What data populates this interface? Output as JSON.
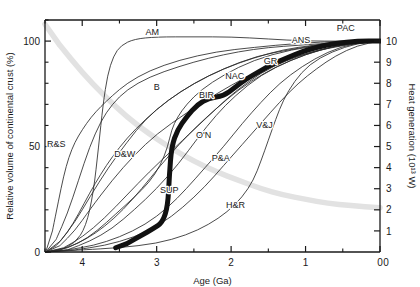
{
  "chart_data": {
    "type": "line",
    "title": "",
    "xlabel": "Age (Ga)",
    "ylabel_left": "Relative volume of continental crust (%)",
    "ylabel_right": "Heat generation (10¹³ W)",
    "xlim": [
      4.5,
      0
    ],
    "xticks": [
      4,
      3,
      2,
      1,
      0
    ],
    "xticks_minor": [
      4.5,
      3.5,
      2.5,
      1.5,
      0.5
    ],
    "ylim_left": [
      0,
      110
    ],
    "yticks_left": [
      0,
      50,
      100
    ],
    "yticks_left_minor": [
      10,
      20,
      30,
      40,
      60,
      70,
      80,
      90,
      110
    ],
    "ylim_right": [
      0,
      11
    ],
    "yticks_right": [
      1,
      2,
      3,
      4,
      5,
      6,
      7,
      8,
      9,
      10
    ],
    "grid": false,
    "legend_position": "inline-annotations",
    "colors": {
      "axis": "#1a1a1a",
      "curve": "#2b2b2b",
      "highlight_curve": "#111111",
      "gray_curve": "#e2e2e2"
    },
    "annotations": [
      {
        "label": "AM",
        "x_ga": 3.06,
        "y_pct": 103
      },
      {
        "label": "ANS",
        "x_ga": 1.06,
        "y_pct": 99
      },
      {
        "label": "PAC",
        "x_ga": 0.46,
        "y_pct": 105
      },
      {
        "label": "GR",
        "x_ga": 1.47,
        "y_pct": 89
      },
      {
        "label": "NAC",
        "x_ga": 1.95,
        "y_pct": 82
      },
      {
        "label": "BIR",
        "x_ga": 2.33,
        "y_pct": 73
      },
      {
        "label": "B",
        "x_ga": 3.0,
        "y_pct": 77
      },
      {
        "label": "O'N",
        "x_ga": 2.37,
        "y_pct": 54
      },
      {
        "label": "V&J",
        "x_ga": 1.55,
        "y_pct": 59
      },
      {
        "label": "D&W",
        "x_ga": 3.43,
        "y_pct": 45
      },
      {
        "label": "P&A",
        "x_ga": 2.14,
        "y_pct": 43
      },
      {
        "label": "SUP",
        "x_ga": 2.83,
        "y_pct": 28
      },
      {
        "label": "H&R",
        "x_ga": 1.94,
        "y_pct": 21
      },
      {
        "label": "R&S",
        "x_ga": 4.35,
        "y_pct": 50
      }
    ],
    "series": [
      {
        "name": "AM",
        "style": "thin",
        "points": [
          [
            4.49,
            0
          ],
          [
            4.3,
            1
          ],
          [
            4.1,
            4
          ],
          [
            3.95,
            12
          ],
          [
            3.85,
            28
          ],
          [
            3.78,
            50
          ],
          [
            3.72,
            70
          ],
          [
            3.66,
            84
          ],
          [
            3.58,
            93
          ],
          [
            3.48,
            98
          ],
          [
            3.3,
            101
          ],
          [
            3.0,
            102
          ],
          [
            2.5,
            102
          ],
          [
            2.0,
            102
          ],
          [
            1.5,
            101
          ],
          [
            1.0,
            100
          ],
          [
            0.5,
            100
          ],
          [
            0.0,
            100
          ]
        ]
      },
      {
        "name": "ANS",
        "style": "thin",
        "points": [
          [
            4.49,
            0
          ],
          [
            4.35,
            6
          ],
          [
            4.2,
            18
          ],
          [
            4.05,
            34
          ],
          [
            3.9,
            50
          ],
          [
            3.75,
            62
          ],
          [
            3.6,
            70
          ],
          [
            3.4,
            77
          ],
          [
            3.1,
            83
          ],
          [
            2.7,
            88
          ],
          [
            2.3,
            92
          ],
          [
            1.9,
            95
          ],
          [
            1.5,
            97
          ],
          [
            1.1,
            98
          ],
          [
            0.7,
            99
          ],
          [
            0.3,
            100
          ],
          [
            0.0,
            100
          ]
        ]
      },
      {
        "name": "GR",
        "style": "thin",
        "points": [
          [
            4.49,
            0
          ],
          [
            4.3,
            3
          ],
          [
            4.1,
            10
          ],
          [
            3.9,
            20
          ],
          [
            3.6,
            34
          ],
          [
            3.3,
            46
          ],
          [
            3.0,
            56
          ],
          [
            2.6,
            66
          ],
          [
            2.2,
            75
          ],
          [
            1.8,
            83
          ],
          [
            1.45,
            89
          ],
          [
            1.1,
            93
          ],
          [
            0.7,
            97
          ],
          [
            0.35,
            99
          ],
          [
            0.0,
            100
          ]
        ]
      },
      {
        "name": "NAC",
        "style": "thin",
        "points": [
          [
            4.49,
            0
          ],
          [
            4.25,
            2
          ],
          [
            4.0,
            7
          ],
          [
            3.7,
            16
          ],
          [
            3.4,
            27
          ],
          [
            3.1,
            38
          ],
          [
            2.8,
            48
          ],
          [
            2.5,
            58
          ],
          [
            2.2,
            68
          ],
          [
            1.95,
            76
          ],
          [
            1.6,
            85
          ],
          [
            1.25,
            91
          ],
          [
            0.9,
            95
          ],
          [
            0.5,
            98
          ],
          [
            0.0,
            100
          ]
        ]
      },
      {
        "name": "BIR",
        "style": "thin",
        "points": [
          [
            4.49,
            0
          ],
          [
            4.2,
            1
          ],
          [
            3.9,
            5
          ],
          [
            3.6,
            11
          ],
          [
            3.3,
            20
          ],
          [
            3.0,
            30
          ],
          [
            2.7,
            42
          ],
          [
            2.45,
            54
          ],
          [
            2.2,
            65
          ],
          [
            1.95,
            74
          ],
          [
            1.6,
            84
          ],
          [
            1.2,
            91
          ],
          [
            0.8,
            96
          ],
          [
            0.4,
            99
          ],
          [
            0.0,
            100
          ]
        ]
      },
      {
        "name": "B",
        "style": "thin",
        "points": [
          [
            4.49,
            0
          ],
          [
            4.3,
            5
          ],
          [
            4.1,
            14
          ],
          [
            3.9,
            26
          ],
          [
            3.65,
            40
          ],
          [
            3.4,
            52
          ],
          [
            3.15,
            63
          ],
          [
            2.85,
            72
          ],
          [
            2.5,
            80
          ],
          [
            2.1,
            87
          ],
          [
            1.7,
            92
          ],
          [
            1.3,
            96
          ],
          [
            0.9,
            98
          ],
          [
            0.45,
            100
          ],
          [
            0.0,
            100
          ]
        ]
      },
      {
        "name": "R&S",
        "style": "thin",
        "points": [
          [
            4.49,
            0
          ],
          [
            4.4,
            10
          ],
          [
            4.32,
            24
          ],
          [
            4.25,
            36
          ],
          [
            4.18,
            45
          ],
          [
            4.1,
            52
          ],
          [
            4.0,
            58
          ],
          [
            3.88,
            64
          ],
          [
            3.75,
            69
          ],
          [
            3.6,
            74
          ],
          [
            3.4,
            80
          ],
          [
            3.1,
            86
          ],
          [
            2.7,
            91
          ],
          [
            2.2,
            95
          ],
          [
            1.7,
            97
          ],
          [
            1.1,
            99
          ],
          [
            0.5,
            100
          ],
          [
            0.0,
            100
          ]
        ]
      },
      {
        "name": "D&W",
        "style": "thin",
        "points": [
          [
            4.49,
            0
          ],
          [
            4.35,
            3
          ],
          [
            4.2,
            9
          ],
          [
            4.05,
            18
          ],
          [
            3.9,
            28
          ],
          [
            3.75,
            37
          ],
          [
            3.6,
            45
          ],
          [
            3.4,
            54
          ],
          [
            3.15,
            63
          ],
          [
            2.85,
            72
          ],
          [
            2.5,
            80
          ],
          [
            2.1,
            87
          ],
          [
            1.65,
            93
          ],
          [
            1.2,
            96
          ],
          [
            0.7,
            99
          ],
          [
            0.0,
            100
          ]
        ]
      },
      {
        "name": "O'N",
        "style": "thin",
        "points": [
          [
            4.49,
            0
          ],
          [
            4.2,
            2
          ],
          [
            3.95,
            6
          ],
          [
            3.7,
            12
          ],
          [
            3.45,
            20
          ],
          [
            3.2,
            30
          ],
          [
            2.95,
            41
          ],
          [
            2.7,
            51
          ],
          [
            2.45,
            60
          ],
          [
            2.2,
            68
          ],
          [
            1.9,
            77
          ],
          [
            1.55,
            85
          ],
          [
            1.2,
            91
          ],
          [
            0.8,
            96
          ],
          [
            0.4,
            99
          ],
          [
            0.0,
            100
          ]
        ]
      },
      {
        "name": "V&J",
        "style": "thin",
        "points": [
          [
            4.49,
            0
          ],
          [
            4.1,
            1
          ],
          [
            3.7,
            3
          ],
          [
            3.3,
            7
          ],
          [
            2.95,
            13
          ],
          [
            2.65,
            21
          ],
          [
            2.35,
            31
          ],
          [
            2.1,
            41
          ],
          [
            1.85,
            51
          ],
          [
            1.6,
            61
          ],
          [
            1.35,
            71
          ],
          [
            1.1,
            80
          ],
          [
            0.85,
            87
          ],
          [
            0.6,
            93
          ],
          [
            0.3,
            98
          ],
          [
            0.0,
            100
          ]
        ]
      },
      {
        "name": "P&A",
        "style": "thin",
        "points": [
          [
            4.49,
            0
          ],
          [
            4.2,
            1
          ],
          [
            3.85,
            3
          ],
          [
            3.5,
            7
          ],
          [
            3.15,
            13
          ],
          [
            2.85,
            21
          ],
          [
            2.6,
            30
          ],
          [
            2.35,
            40
          ],
          [
            2.1,
            50
          ],
          [
            1.85,
            61
          ],
          [
            1.6,
            71
          ],
          [
            1.35,
            80
          ],
          [
            1.05,
            88
          ],
          [
            0.7,
            95
          ],
          [
            0.35,
            99
          ],
          [
            0.0,
            100
          ]
        ]
      },
      {
        "name": "SUP",
        "style": "thin",
        "points": [
          [
            4.49,
            0
          ],
          [
            4.3,
            1
          ],
          [
            4.05,
            4
          ],
          [
            3.8,
            10
          ],
          [
            3.55,
            18
          ],
          [
            3.3,
            26
          ],
          [
            3.1,
            33
          ],
          [
            2.95,
            41
          ],
          [
            2.85,
            50
          ],
          [
            2.8,
            58
          ],
          [
            2.72,
            64
          ],
          [
            2.6,
            70
          ],
          [
            2.4,
            77
          ],
          [
            2.1,
            84
          ],
          [
            1.7,
            91
          ],
          [
            1.2,
            96
          ],
          [
            0.6,
            99
          ],
          [
            0.0,
            100
          ]
        ]
      },
      {
        "name": "H&R",
        "style": "thin",
        "points": [
          [
            4.49,
            0
          ],
          [
            4.0,
            1
          ],
          [
            3.5,
            2
          ],
          [
            3.0,
            4
          ],
          [
            2.6,
            8
          ],
          [
            2.3,
            13
          ],
          [
            2.05,
            19
          ],
          [
            1.85,
            26
          ],
          [
            1.7,
            34
          ],
          [
            1.6,
            43
          ],
          [
            1.5,
            53
          ],
          [
            1.4,
            63
          ],
          [
            1.3,
            72
          ],
          [
            1.15,
            81
          ],
          [
            0.95,
            89
          ],
          [
            0.65,
            95
          ],
          [
            0.3,
            99
          ],
          [
            0.0,
            100
          ]
        ]
      },
      {
        "name": "PAC",
        "style": "bold",
        "points": [
          [
            3.55,
            2
          ],
          [
            3.4,
            4
          ],
          [
            3.2,
            8
          ],
          [
            3.05,
            11
          ],
          [
            2.92,
            14
          ],
          [
            2.85,
            22
          ],
          [
            2.83,
            36
          ],
          [
            2.8,
            50
          ],
          [
            2.72,
            58
          ],
          [
            2.6,
            64
          ],
          [
            2.45,
            70
          ],
          [
            2.3,
            73
          ],
          [
            2.1,
            74
          ],
          [
            1.95,
            78
          ],
          [
            1.8,
            82
          ],
          [
            1.6,
            86
          ],
          [
            1.45,
            89
          ],
          [
            1.25,
            92
          ],
          [
            1.05,
            95
          ],
          [
            0.85,
            97
          ],
          [
            0.6,
            99
          ],
          [
            0.3,
            100
          ],
          [
            0.0,
            100
          ]
        ]
      },
      {
        "name": "gray-decay",
        "style": "gray",
        "points": [
          [
            4.5,
            108
          ],
          [
            4.3,
            98
          ],
          [
            4.0,
            85
          ],
          [
            3.7,
            74
          ],
          [
            3.4,
            64
          ],
          [
            3.1,
            56
          ],
          [
            2.8,
            49
          ],
          [
            2.5,
            43
          ],
          [
            2.2,
            38
          ],
          [
            1.9,
            34
          ],
          [
            1.6,
            30
          ],
          [
            1.3,
            27
          ],
          [
            1.0,
            25
          ],
          [
            0.7,
            23
          ],
          [
            0.4,
            22
          ],
          [
            0.0,
            21
          ]
        ]
      }
    ]
  },
  "meta": {
    "x_tick_labels": [
      "4",
      "3",
      "2",
      "1",
      "0"
    ],
    "y_left_tick_labels": [
      "0",
      "50",
      "100"
    ],
    "y_right_tick_labels": [
      "1",
      "2",
      "3",
      "4",
      "5",
      "6",
      "7",
      "8",
      "9",
      "10"
    ]
  }
}
